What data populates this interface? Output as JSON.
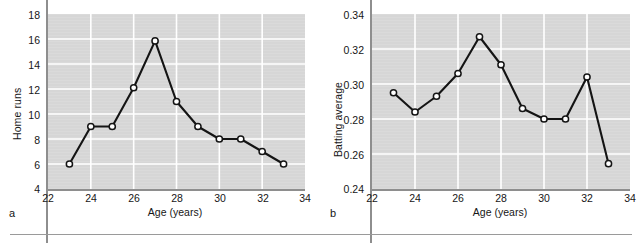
{
  "figure": {
    "background": "#ffffff",
    "plot_background": "#d6d6d6",
    "gridline_color": "#ffffff",
    "line_color": "#141414",
    "marker_fill": "#ffffff",
    "axis_color": "#8e8e8e",
    "divider_color": "#9a9a9a"
  },
  "panels": [
    {
      "label": "a",
      "xlabel": "Age (years)",
      "ylabel": "Home runs",
      "xticks": [
        "22",
        "24",
        "26",
        "28",
        "30",
        "32",
        "34"
      ],
      "yticks": [
        "18",
        "16",
        "14",
        "12",
        "10",
        "8",
        "6",
        "4"
      ]
    },
    {
      "label": "b",
      "xlabel": "Age (years)",
      "ylabel": "Batting average",
      "xticks": [
        "22",
        "24",
        "26",
        "28",
        "30",
        "32",
        "34"
      ],
      "yticks": [
        "0.34",
        "0.32",
        "0.30",
        "0.28",
        "0.26",
        "0.24"
      ]
    }
  ],
  "chart_data": [
    {
      "type": "line",
      "title": "",
      "panel_label": "a",
      "xlabel": "Age (years)",
      "ylabel": "Home runs",
      "x": [
        23,
        24,
        25,
        26,
        27,
        28,
        29,
        30,
        31,
        32,
        33
      ],
      "values": [
        6,
        9,
        9,
        12.1,
        15.85,
        11,
        9,
        8,
        8,
        7,
        6
      ],
      "xlim": [
        22,
        34
      ],
      "ylim": [
        4,
        18
      ],
      "xticks": [
        22,
        24,
        26,
        28,
        30,
        32,
        34
      ],
      "yticks": [
        4,
        6,
        8,
        10,
        12,
        14,
        16,
        18
      ],
      "grid": true,
      "legend": "none",
      "marker": "open-circle"
    },
    {
      "type": "line",
      "title": "",
      "panel_label": "b",
      "xlabel": "Age (years)",
      "ylabel": "Batting average",
      "x": [
        23,
        24,
        25,
        26,
        27,
        28,
        29,
        30,
        31,
        32,
        33
      ],
      "values": [
        0.295,
        0.284,
        0.293,
        0.306,
        0.327,
        0.311,
        0.286,
        0.28,
        0.28,
        0.304,
        0.2545
      ],
      "xlim": [
        22,
        34
      ],
      "ylim": [
        0.24,
        0.34
      ],
      "xticks": [
        22,
        24,
        26,
        28,
        30,
        32,
        34
      ],
      "yticks": [
        0.24,
        0.26,
        0.28,
        0.3,
        0.32,
        0.34
      ],
      "grid": true,
      "legend": "none",
      "marker": "open-circle"
    }
  ]
}
